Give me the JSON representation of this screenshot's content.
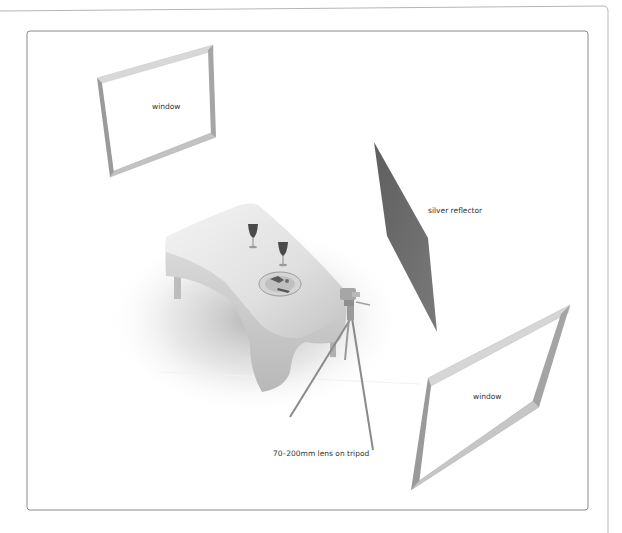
{
  "diagram": {
    "objects": [
      {
        "id": "window-back-left",
        "type": "window",
        "label": "window"
      },
      {
        "id": "silver-reflector",
        "type": "reflector",
        "label": "silver reflector"
      },
      {
        "id": "table",
        "type": "table",
        "label": ""
      },
      {
        "id": "camera-tripod",
        "type": "camera",
        "label": "70–200mm lens on tripod"
      },
      {
        "id": "window-front-right",
        "type": "window",
        "label": "window"
      }
    ],
    "labels": {
      "window_1": "window",
      "reflector": "silver reflector",
      "camera": "70–200mm lens on tripod",
      "window_2": "window"
    },
    "colors": {
      "frame_light": "#d4d4d4",
      "frame_mid": "#b0b0b0",
      "frame_dark": "#8c8c8c",
      "reflector": "#6b6b6b",
      "border": "#8a8a8a",
      "label": "#333333"
    }
  }
}
